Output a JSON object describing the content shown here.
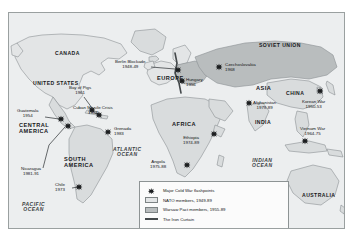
{
  "figure": {
    "kind": "historical-map",
    "title_visible": false
  },
  "colors": {
    "ocean": "#eceeef",
    "neutral_land": "#d9dcdd",
    "nato_fill": "#e3e5e6",
    "warsaw_fill": "#b9bdbe",
    "coastline": "#8b9193",
    "iron_curtain": "#44494b",
    "marker": "#1b1d1f",
    "frame": "#9aa0a0",
    "legend_bg": "#fbfbfb"
  },
  "regions": [
    {
      "name": "CANADA",
      "class": "country",
      "left": 46,
      "top": 38
    },
    {
      "name": "UNITED STATES",
      "class": "country",
      "left": 26,
      "top": 68
    },
    {
      "name": "CENTRAL\nAMERICA",
      "class": "region",
      "left": 10,
      "top": 110
    },
    {
      "name": "SOUTH\nAMERICA",
      "class": "region",
      "left": 55,
      "top": 143
    },
    {
      "name": "EUROPE",
      "class": "region",
      "left": 150,
      "top": 62
    },
    {
      "name": "SOVIET UNION",
      "class": "country",
      "left": 252,
      "top": 31
    },
    {
      "name": "AFRICA",
      "class": "region",
      "left": 163,
      "top": 110
    },
    {
      "name": "ASIA",
      "class": "region",
      "left": 248,
      "top": 72
    },
    {
      "name": "CHINA",
      "class": "country",
      "left": 277,
      "top": 79
    },
    {
      "name": "INDIA",
      "class": "country",
      "left": 247,
      "top": 107
    },
    {
      "name": "AUSTRALIA",
      "class": "country",
      "left": 297,
      "top": 182
    }
  ],
  "oceans": [
    {
      "name": "ATLANTIC\nOCEAN",
      "left": 106,
      "top": 135
    },
    {
      "name": "PACIFIC\nOCEAN",
      "left": 14,
      "top": 190
    },
    {
      "name": "INDIAN\nOCEAN",
      "left": 244,
      "top": 146
    }
  ],
  "flashpoints": [
    {
      "label": "Berlin Blockade",
      "years": "1948-49",
      "label_left": 108,
      "label_top": 48,
      "align": "center",
      "marker_x": 169,
      "marker_y": 57
    },
    {
      "label": "Czechoslovakia",
      "years": "1968",
      "label_left": 216,
      "label_top": 51,
      "align": "left",
      "marker_x": 210,
      "marker_y": 54
    },
    {
      "label": "Hungary",
      "years": "1956",
      "label_left": 176,
      "label_top": 66,
      "align": "left",
      "marker_x": 173,
      "marker_y": 68
    },
    {
      "label": "Bay of Pigs",
      "years": "1961",
      "label_left": 62,
      "label_top": 75,
      "align": "center",
      "marker_x": 83,
      "marker_y": 97
    },
    {
      "label": "Cuban Missile Crisis",
      "years": "1962",
      "label_left": 68,
      "label_top": 95,
      "align": "center",
      "marker_x": 89,
      "marker_y": 101
    },
    {
      "label": "Guatemala",
      "years": "1954",
      "label_left": 14,
      "label_top": 98,
      "align": "center",
      "marker_x": 52,
      "marker_y": 106
    },
    {
      "label": "Grenada",
      "years": "1983",
      "label_left": 105,
      "label_top": 116,
      "align": "left",
      "marker_x": 99,
      "marker_y": 119
    },
    {
      "label": "Nicaragua",
      "years": "1981-91",
      "label_left": 16,
      "label_top": 156,
      "align": "center",
      "marker_x": 59,
      "marker_y": 113
    },
    {
      "label": "Chile",
      "years": "1973",
      "label_left": 49,
      "label_top": 172,
      "align": "center",
      "marker_x": 70,
      "marker_y": 174
    },
    {
      "label": "Ethiopia",
      "years": "1974-89",
      "label_left": 176,
      "label_top": 124,
      "align": "center",
      "marker_x": 205,
      "marker_y": 121
    },
    {
      "label": "Angola",
      "years": "1975-88",
      "label_left": 143,
      "label_top": 149,
      "align": "center",
      "marker_x": 178,
      "marker_y": 152
    },
    {
      "label": "Afghanistan",
      "years": "1979-89",
      "label_left": 246,
      "label_top": 89,
      "align": "center",
      "marker_x": 240,
      "marker_y": 90
    },
    {
      "label": "Korean War",
      "years": "1950-53",
      "label_left": 296,
      "label_top": 89,
      "align": "center",
      "marker_x": 311,
      "marker_y": 78
    },
    {
      "label": "Vietnam War",
      "years": "1964-75",
      "label_left": 294,
      "label_top": 116,
      "align": "center",
      "marker_x": 296,
      "marker_y": 128
    }
  ],
  "legend": {
    "rows": [
      {
        "key": "star",
        "text": "Major Cold War flashpoints"
      },
      {
        "key": "nato",
        "text": "NATO members, 1949-89"
      },
      {
        "key": "warsaw",
        "text": "Warsaw Pact members, 1955-89"
      },
      {
        "key": "curtain",
        "text": "The Iron Curtain"
      }
    ]
  }
}
